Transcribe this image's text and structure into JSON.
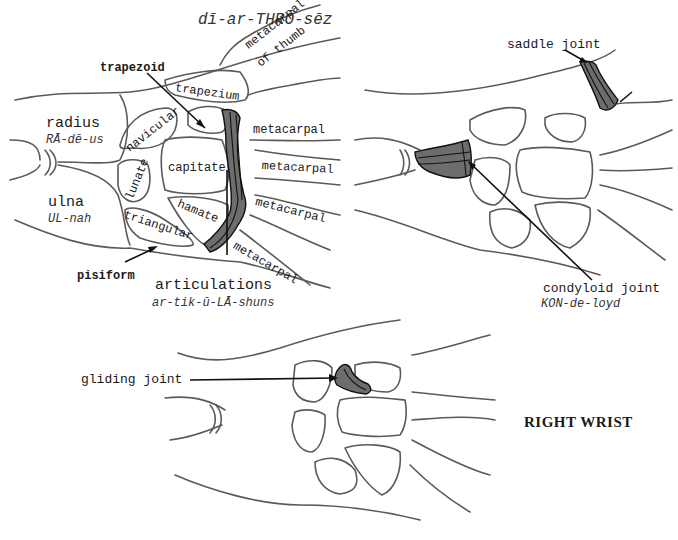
{
  "header": {
    "pronunciation": "dī-ar-THRŌ-sēz"
  },
  "panel_left": {
    "labels": {
      "trapezoid": "trapezoid",
      "metacarpal_of_thumb_line1": "metacarpal",
      "metacarpal_of_thumb_line2": "of thumb",
      "trapezium": "trapezium",
      "radius": "radius",
      "radius_pron": "RĀ-dē-us",
      "navicular": "navicular",
      "capitate": "capitate",
      "lunate": "lunate",
      "hamate": "hamate",
      "ulna": "ulna",
      "ulna_pron": "UL-nah",
      "triangular": "triangular",
      "pisiform": "pisiform",
      "metacarpal_1": "metacarpal",
      "metacarpal_2": "metacarpal",
      "metacarpal_3": "metacarpal",
      "metacarpal_4": "metacarpal",
      "articulations": "articulations",
      "articulations_pron": "ar-tik-ū-LĀ-shuns"
    }
  },
  "panel_right": {
    "labels": {
      "saddle_joint": "saddle joint",
      "condyloid_joint": "condyloid joint",
      "condyloid_pron": "KON-de-loyd"
    }
  },
  "panel_bottom": {
    "labels": {
      "gliding_joint": "gliding joint"
    }
  },
  "caption": "RIGHT WRIST",
  "colors": {
    "bone_outline": "#5a5a5a",
    "joint_fill": "#6d6d6d",
    "ink": "#1a1a1a",
    "background": "#ffffff"
  }
}
